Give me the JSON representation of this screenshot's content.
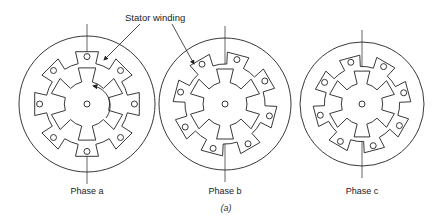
{
  "figure": {
    "caption": "(a)",
    "callout_label": "Stator winding",
    "motors": [
      {
        "id": "a",
        "label": "Phase a",
        "cx": 87,
        "cy": 104,
        "r": 68
      },
      {
        "id": "b",
        "label": "Phase b",
        "cx": 225,
        "cy": 104,
        "r": 66
      },
      {
        "id": "c",
        "label": "Phase c",
        "cx": 362,
        "cy": 104,
        "r": 62
      }
    ],
    "stator_poles": 8,
    "rotor_teeth": 6
  },
  "colors": {
    "line": "#222222",
    "background": "#ffffff"
  }
}
